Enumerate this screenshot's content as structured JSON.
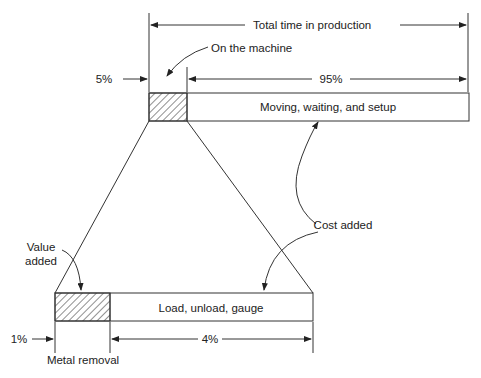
{
  "top": {
    "total_label": "Total time in production",
    "machine_label": "On the machine",
    "pct_5": "5%",
    "pct_95": "95%",
    "bar_label": "Moving, waiting, and setup"
  },
  "bottom": {
    "value_added_line1": "Value",
    "value_added_line2": "added",
    "bar_label": "Load, unload, gauge",
    "pct_1": "1%",
    "pct_4": "4%",
    "metal_label": "Metal removal"
  },
  "cost_added_label": "Cost added"
}
